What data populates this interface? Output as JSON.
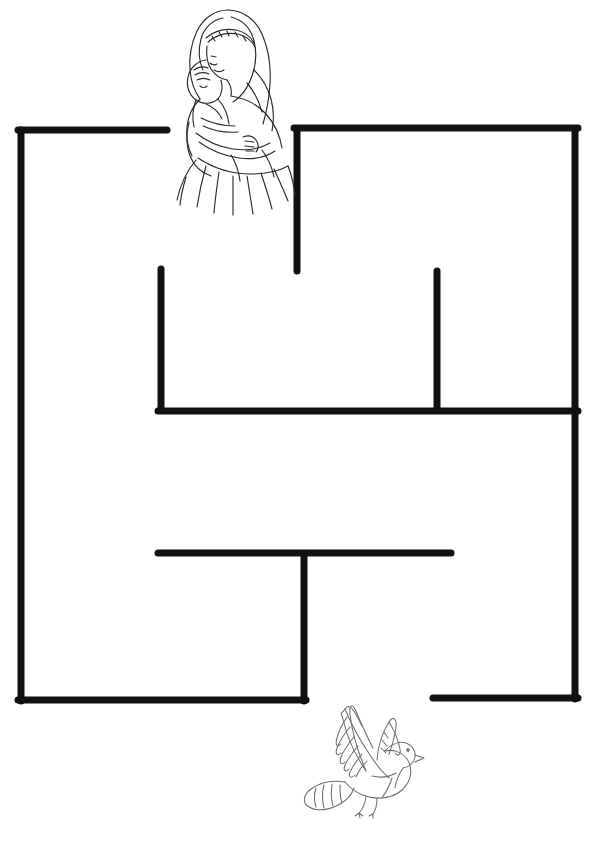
{
  "page": {
    "title": "Mother and Child Maze",
    "width": 597,
    "height": 841,
    "background_color": "#ffffff",
    "type": "printable activity worksheet"
  },
  "maze": {
    "wall_color": "#111111",
    "wall_thickness": 7,
    "line_cap": "round",
    "entrance_label": "top entrance gap",
    "exit_label": "bottom exit gap",
    "walls": [
      {
        "name": "left-border",
        "x1": 21,
        "y1": 130,
        "x2": 21,
        "y2": 701
      },
      {
        "name": "top-left-horizontal",
        "x1": 18,
        "y1": 130,
        "x2": 167,
        "y2": 130
      },
      {
        "name": "top-right-vertical",
        "x1": 297,
        "y1": 131,
        "x2": 297,
        "y2": 271
      },
      {
        "name": "top-right-horizontal",
        "x1": 294,
        "y1": 128,
        "x2": 578,
        "y2": 128
      },
      {
        "name": "right-border",
        "x1": 575,
        "y1": 130,
        "x2": 575,
        "y2": 699
      },
      {
        "name": "mid-left-vertical",
        "x1": 161,
        "y1": 269,
        "x2": 161,
        "y2": 410
      },
      {
        "name": "mid-horizontal",
        "x1": 158,
        "y1": 411,
        "x2": 578,
        "y2": 411
      },
      {
        "name": "mid-right-vertical",
        "x1": 437,
        "y1": 271,
        "x2": 437,
        "y2": 409
      },
      {
        "name": "lower-horizontal",
        "x1": 158,
        "y1": 553,
        "x2": 451,
        "y2": 553
      },
      {
        "name": "lower-center-vertical",
        "x1": 304,
        "y1": 555,
        "x2": 304,
        "y2": 701
      },
      {
        "name": "bottom-left-horizontal",
        "x1": 18,
        "y1": 700,
        "x2": 306,
        "y2": 700
      },
      {
        "name": "bottom-right-horizontal",
        "x1": 433,
        "y1": 698,
        "x2": 578,
        "y2": 698
      }
    ],
    "gaps": [
      {
        "name": "entrance",
        "side": "top",
        "from_x": 167,
        "to_x": 294,
        "y": 129
      },
      {
        "name": "exit",
        "side": "bottom",
        "from_x": 306,
        "to_x": 433,
        "y": 699
      }
    ]
  },
  "artwork": {
    "mother_and_child": {
      "name": "mother-and-child-illustration",
      "description": "Line drawing of a veiled mother cradling an infant, long flowing skirt",
      "x": 175,
      "y": 5,
      "width": 112,
      "height": 175,
      "line_color": "#2b2b2b",
      "position_note": "centered over the top entrance gap"
    },
    "dove": {
      "name": "dove-illustration",
      "description": "Line drawing of a dove in flight with raised wings and fanned tail",
      "x": 308,
      "y": 700,
      "width": 115,
      "height": 118,
      "line_color": "#6e6e6e",
      "position_note": "below the bottom exit gap"
    }
  }
}
